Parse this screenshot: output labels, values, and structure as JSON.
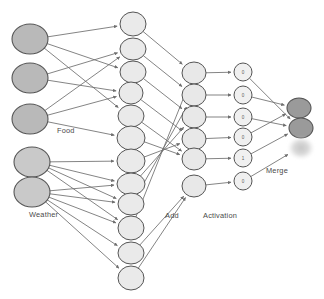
{
  "figure": {
    "type": "neural-network-diagram",
    "background": "#ffffff",
    "width": 324,
    "height": 299
  },
  "colors": {
    "input_food_fill": "#b9b9b9",
    "input_weather_fill": "#c9c9c9",
    "hidden_fill": "#eaeaea",
    "add_fill": "#e8e8e8",
    "activation_fill": "#f0f0f0",
    "merge_fill": "#9a9a9a",
    "merge_ghost_fill": "#cccccc",
    "stroke": "#555555",
    "edge": "#6e6e6e",
    "label_text": "#4a4a4a"
  },
  "labels": {
    "food": "Food",
    "weather": "Weather",
    "add": "Add",
    "activation": "Activation",
    "merge": "Merge"
  },
  "layers": {
    "input": {
      "name": "input",
      "count": 5,
      "groups": [
        {
          "group": "Food",
          "count": 3
        },
        {
          "group": "Weather",
          "count": 2
        }
      ],
      "nodes": [
        {
          "id": "in-1",
          "group": "Food",
          "cx": 30,
          "cy": 39,
          "rx": 18,
          "ry": 15
        },
        {
          "id": "in-2",
          "group": "Food",
          "cx": 30,
          "cy": 78,
          "rx": 18,
          "ry": 15
        },
        {
          "id": "in-3",
          "group": "Food",
          "cx": 30,
          "cy": 119,
          "rx": 18,
          "ry": 15
        },
        {
          "id": "in-4",
          "group": "Weather",
          "cx": 32,
          "cy": 162,
          "rx": 18,
          "ry": 15
        },
        {
          "id": "in-5",
          "group": "Weather",
          "cx": 32,
          "cy": 192,
          "rx": 18,
          "ry": 15
        }
      ]
    },
    "hidden": {
      "name": "hidden",
      "count": 12,
      "nodes": [
        {
          "id": "h-1",
          "cx": 133,
          "cy": 24,
          "rx": 13,
          "ry": 12
        },
        {
          "id": "h-2",
          "cx": 133,
          "cy": 49,
          "rx": 13,
          "ry": 11
        },
        {
          "id": "h-3",
          "cx": 133,
          "cy": 72,
          "rx": 13,
          "ry": 11
        },
        {
          "id": "h-4",
          "cx": 131,
          "cy": 93,
          "rx": 12,
          "ry": 11
        },
        {
          "id": "h-5",
          "cx": 131,
          "cy": 116,
          "rx": 13,
          "ry": 11
        },
        {
          "id": "h-6",
          "cx": 131,
          "cy": 138,
          "rx": 14,
          "ry": 12
        },
        {
          "id": "h-7",
          "cx": 131,
          "cy": 161,
          "rx": 14,
          "ry": 12
        },
        {
          "id": "h-8",
          "cx": 131,
          "cy": 184,
          "rx": 14,
          "ry": 11
        },
        {
          "id": "h-9",
          "cx": 131,
          "cy": 204,
          "rx": 13,
          "ry": 11
        },
        {
          "id": "h-10",
          "cx": 131,
          "cy": 228,
          "rx": 13,
          "ry": 12
        },
        {
          "id": "h-11",
          "cx": 131,
          "cy": 253,
          "rx": 13,
          "ry": 11
        },
        {
          "id": "h-12",
          "cx": 131,
          "cy": 278,
          "rx": 13,
          "ry": 12
        }
      ]
    },
    "add": {
      "name": "add",
      "count": 6,
      "nodes": [
        {
          "id": "a-1",
          "cx": 194,
          "cy": 73,
          "rx": 12,
          "ry": 11
        },
        {
          "id": "a-2",
          "cx": 194,
          "cy": 95,
          "rx": 12,
          "ry": 11
        },
        {
          "id": "a-3",
          "cx": 194,
          "cy": 117,
          "rx": 12,
          "ry": 11
        },
        {
          "id": "a-4",
          "cx": 194,
          "cy": 139,
          "rx": 12,
          "ry": 11
        },
        {
          "id": "a-5",
          "cx": 194,
          "cy": 159,
          "rx": 12,
          "ry": 11
        },
        {
          "id": "a-6",
          "cx": 194,
          "cy": 186,
          "rx": 12,
          "ry": 11
        }
      ]
    },
    "activation": {
      "name": "activation",
      "count": 6,
      "nodes": [
        {
          "id": "act-1",
          "cx": 243,
          "cy": 72,
          "rx": 9,
          "ry": 9,
          "value": "0"
        },
        {
          "id": "act-2",
          "cx": 243,
          "cy": 95,
          "rx": 9,
          "ry": 9,
          "value": "0"
        },
        {
          "id": "act-3",
          "cx": 243,
          "cy": 117,
          "rx": 9,
          "ry": 9,
          "value": "0"
        },
        {
          "id": "act-4",
          "cx": 243,
          "cy": 137,
          "rx": 9,
          "ry": 9,
          "value": "0"
        },
        {
          "id": "act-5",
          "cx": 243,
          "cy": 158,
          "rx": 9,
          "ry": 9,
          "value": "1"
        },
        {
          "id": "act-6",
          "cx": 243,
          "cy": 181,
          "rx": 9,
          "ry": 9,
          "value": "0"
        }
      ],
      "values": [
        "0",
        "0",
        "0",
        "0",
        "1",
        "0"
      ]
    },
    "merge": {
      "name": "merge",
      "count": 3,
      "nodes": [
        {
          "id": "m-1",
          "cx": 299,
          "cy": 108,
          "rx": 12,
          "ry": 10,
          "style": "solid"
        },
        {
          "id": "m-2",
          "cx": 301,
          "cy": 128,
          "rx": 12,
          "ry": 10,
          "style": "solid"
        },
        {
          "id": "m-3",
          "cx": 301,
          "cy": 148,
          "rx": 12,
          "ry": 10,
          "style": "ghost"
        }
      ]
    }
  },
  "label_positions": {
    "food": {
      "x": 57,
      "y": 126
    },
    "weather": {
      "x": 29,
      "y": 210
    },
    "add": {
      "x": 165,
      "y": 211
    },
    "activation": {
      "x": 203,
      "y": 211
    },
    "merge": {
      "x": 266,
      "y": 166
    }
  },
  "edges": {
    "input_to_hidden": [
      {
        "from": "in-1",
        "to": "h-1"
      },
      {
        "from": "in-1",
        "to": "h-3"
      },
      {
        "from": "in-1",
        "to": "h-5"
      },
      {
        "from": "in-2",
        "to": "h-2"
      },
      {
        "from": "in-2",
        "to": "h-4"
      },
      {
        "from": "in-3",
        "to": "h-2"
      },
      {
        "from": "in-3",
        "to": "h-4"
      },
      {
        "from": "in-3",
        "to": "h-6"
      },
      {
        "from": "in-4",
        "to": "h-7"
      },
      {
        "from": "in-4",
        "to": "h-8"
      },
      {
        "from": "in-4",
        "to": "h-9"
      },
      {
        "from": "in-4",
        "to": "h-10"
      },
      {
        "from": "in-5",
        "to": "h-8"
      },
      {
        "from": "in-5",
        "to": "h-9"
      },
      {
        "from": "in-5",
        "to": "h-10"
      },
      {
        "from": "in-5",
        "to": "h-11"
      },
      {
        "from": "in-5",
        "to": "h-12"
      }
    ],
    "hidden_to_add": [
      {
        "from": "h-1",
        "to": "a-1"
      },
      {
        "from": "h-2",
        "to": "a-2"
      },
      {
        "from": "h-3",
        "to": "a-3"
      },
      {
        "from": "h-4",
        "to": "a-4"
      },
      {
        "from": "h-5",
        "to": "a-5"
      },
      {
        "from": "h-6",
        "to": "a-5"
      },
      {
        "from": "h-7",
        "to": "a-4"
      },
      {
        "from": "h-8",
        "to": "a-3"
      },
      {
        "from": "h-9",
        "to": "a-2"
      },
      {
        "from": "h-10",
        "to": "a-1"
      },
      {
        "from": "h-11",
        "to": "a-6"
      },
      {
        "from": "h-12",
        "to": "a-6"
      }
    ],
    "add_to_activation": [
      {
        "from": "a-1",
        "to": "act-1"
      },
      {
        "from": "a-2",
        "to": "act-2"
      },
      {
        "from": "a-3",
        "to": "act-3"
      },
      {
        "from": "a-4",
        "to": "act-4"
      },
      {
        "from": "a-5",
        "to": "act-5"
      },
      {
        "from": "a-6",
        "to": "act-6"
      }
    ],
    "activation_to_merge": [
      {
        "from": "act-1",
        "to": "m-2"
      },
      {
        "from": "act-2",
        "to": "m-1"
      },
      {
        "from": "act-3",
        "to": "m-2"
      },
      {
        "from": "act-4",
        "to": "m-1"
      },
      {
        "from": "act-5",
        "to": "m-2"
      },
      {
        "from": "act-6",
        "to": "m-3"
      }
    ]
  }
}
